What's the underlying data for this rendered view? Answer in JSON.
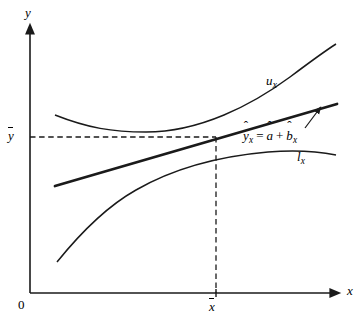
{
  "figure": {
    "background": "#ffffff",
    "stroke_color": "#1a1a1a",
    "width": 362,
    "height": 321
  },
  "axes": {
    "y_label": "y",
    "x_label": "x",
    "origin_label": "0",
    "y_mean_label": "y",
    "y_mean_overbar": true,
    "x_mean_label": "x",
    "x_mean_overbar": true,
    "y_axis_x": 30,
    "x_axis_y": 293,
    "x_axis_end": 335,
    "y_axis_top": 28
  },
  "curves": {
    "upper": {
      "label": "u",
      "subscript": "x",
      "label_x": 266,
      "label_y": 74,
      "path": "M 55 115 C 88 128, 112 132, 146 132 C 200 132, 252 105, 290 77 C 310 62, 325 51, 336 44"
    },
    "lower": {
      "label": "l",
      "subscript": "x",
      "label_x": 297,
      "label_y": 150,
      "path": "M 57 262 C 78 236, 104 208, 136 190 C 176 167, 222 156, 268 152 C 292 150, 316 151, 336 155"
    },
    "regression": {
      "equation_parts": {
        "yhat": "y",
        "yhat_sub": "x",
        "equals": "=",
        "ahat": "a",
        "plus": "+",
        "bhat": "b",
        "bhat_sub": "x"
      },
      "equation_text": "ŷx = â + b̂x",
      "label_x": 243,
      "label_y": 129,
      "x1": 55,
      "y1": 186,
      "x2": 337,
      "y2": 104,
      "stroke_width": 2.6
    }
  },
  "annotations": {
    "arrow": {
      "from_x": 305,
      "from_y": 128,
      "to_x": 318,
      "to_y": 111
    },
    "dashed_horizontal": {
      "x1": 30,
      "y1": 137,
      "x2": 216,
      "y2": 137
    },
    "dashed_vertical": {
      "x1": 216,
      "y1": 137,
      "x2": 216,
      "y2": 293
    },
    "x_tick": {
      "x": 216,
      "y1": 289,
      "y2": 297
    }
  }
}
